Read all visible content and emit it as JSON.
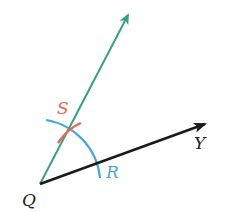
{
  "diagram": {
    "type": "geometric-construction",
    "points": {
      "Q": {
        "label": "Q",
        "x": 40,
        "y": 184
      },
      "S": {
        "label": "S",
        "x": 67,
        "y": 131
      },
      "R": {
        "label": "R",
        "x": 97,
        "y": 164
      },
      "Y": {
        "label": "Y"
      }
    },
    "rays": [
      {
        "name": "ray-QY",
        "from": "Q",
        "toward": "Y",
        "color": "#1a1a1a"
      },
      {
        "name": "ray-QS",
        "from": "Q",
        "through": "S",
        "color": "#3a9e88"
      }
    ],
    "arcs": [
      {
        "name": "arc-centered-Q",
        "color": "#4aa8d8"
      },
      {
        "name": "arc-from-R",
        "color": "#e8674f"
      }
    ],
    "colors": {
      "ray_teal": "#3a9e88",
      "ray_black": "#1a1a1a",
      "arc_blue": "#4aa8d8",
      "arc_red": "#e8674f",
      "label_S": "#e8674f",
      "label_R": "#4aa8d8",
      "label_default": "#222222"
    }
  },
  "labels": {
    "Q": "Q",
    "S": "S",
    "R": "R",
    "Y": "Y"
  }
}
